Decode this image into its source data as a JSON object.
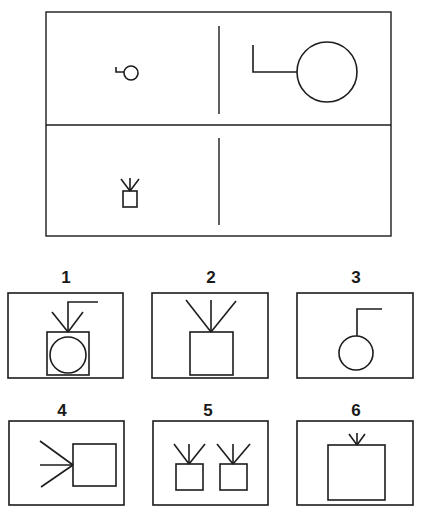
{
  "colors": {
    "ink": "#1c1c1c",
    "background": "#ffffff"
  },
  "matrix": {
    "frame": {
      "x": 46,
      "y": 12,
      "w": 345,
      "h": 224
    },
    "horizontal_divider_y": 125,
    "vertical_dividers": [
      {
        "x": 219,
        "y1": 26,
        "y2": 114
      },
      {
        "x": 219,
        "y1": 138,
        "y2": 225
      }
    ],
    "cells": [
      {
        "id": "top-left",
        "description": "small circle with small L-shaped hook on its left",
        "shapes": [
          {
            "type": "circle",
            "cx": 131,
            "cy": 73,
            "r": 7
          },
          {
            "type": "polyline",
            "points": [
              [
                116,
                67
              ],
              [
                116,
                72
              ],
              [
                124,
                72
              ]
            ]
          }
        ]
      },
      {
        "id": "top-right",
        "description": "large circle with large L-shaped hook on its left",
        "shapes": [
          {
            "type": "circle",
            "cx": 327,
            "cy": 72,
            "r": 30
          },
          {
            "type": "polyline",
            "points": [
              [
                253,
                45
              ],
              [
                253,
                72
              ],
              [
                297,
                72
              ]
            ]
          }
        ]
      },
      {
        "id": "bottom-left",
        "description": "small square with three rays on top",
        "shapes": [
          {
            "type": "rect",
            "x": 123,
            "y": 191,
            "w": 14,
            "h": 16
          },
          {
            "type": "line",
            "x1": 130,
            "y1": 191,
            "x2": 121,
            "y2": 179
          },
          {
            "type": "line",
            "x1": 130,
            "y1": 191,
            "x2": 130,
            "y2": 178
          },
          {
            "type": "line",
            "x1": 130,
            "y1": 191,
            "x2": 139,
            "y2": 179
          }
        ]
      },
      {
        "id": "bottom-right",
        "description": "empty cell (missing answer)",
        "shapes": []
      }
    ]
  },
  "options": [
    {
      "label": "1",
      "label_pos": {
        "x": 66,
        "y": 269
      },
      "frame": {
        "x": 8,
        "y": 293,
        "w": 115,
        "h": 85
      },
      "shapes": [
        {
          "type": "rect",
          "x": 47,
          "y": 332,
          "w": 42,
          "h": 43
        },
        {
          "type": "circle",
          "cx": 68,
          "cy": 355,
          "r": 18
        },
        {
          "type": "line",
          "x1": 68,
          "y1": 332,
          "x2": 52,
          "y2": 312
        },
        {
          "type": "line",
          "x1": 68,
          "y1": 332,
          "x2": 83,
          "y2": 312
        },
        {
          "type": "polyline",
          "points": [
            [
              68,
              332
            ],
            [
              68,
              302
            ],
            [
              98,
              302
            ]
          ]
        }
      ]
    },
    {
      "label": "2",
      "label_pos": {
        "x": 211,
        "y": 269
      },
      "frame": {
        "x": 152,
        "y": 293,
        "w": 116,
        "h": 85
      },
      "shapes": [
        {
          "type": "rect",
          "x": 190,
          "y": 332,
          "w": 43,
          "h": 43
        },
        {
          "type": "line",
          "x1": 211,
          "y1": 332,
          "x2": 186,
          "y2": 300
        },
        {
          "type": "line",
          "x1": 211,
          "y1": 332,
          "x2": 211,
          "y2": 300
        },
        {
          "type": "line",
          "x1": 211,
          "y1": 332,
          "x2": 236,
          "y2": 301
        }
      ]
    },
    {
      "label": "3",
      "label_pos": {
        "x": 356,
        "y": 269
      },
      "frame": {
        "x": 297,
        "y": 293,
        "w": 116,
        "h": 85
      },
      "shapes": [
        {
          "type": "circle",
          "cx": 356,
          "cy": 353,
          "r": 17
        },
        {
          "type": "polyline",
          "points": [
            [
              357,
              336
            ],
            [
              357,
              309
            ],
            [
              382,
              309
            ]
          ]
        }
      ]
    },
    {
      "label": "4",
      "label_pos": {
        "x": 62,
        "y": 402
      },
      "frame": {
        "x": 9,
        "y": 421,
        "w": 115,
        "h": 84
      },
      "shapes": [
        {
          "type": "rect",
          "x": 73,
          "y": 444,
          "w": 43,
          "h": 42
        },
        {
          "type": "line",
          "x1": 73,
          "y1": 465,
          "x2": 40,
          "y2": 441
        },
        {
          "type": "line",
          "x1": 73,
          "y1": 465,
          "x2": 40,
          "y2": 465
        },
        {
          "type": "line",
          "x1": 73,
          "y1": 465,
          "x2": 41,
          "y2": 487
        }
      ]
    },
    {
      "label": "5",
      "label_pos": {
        "x": 208,
        "y": 402
      },
      "frame": {
        "x": 153,
        "y": 421,
        "w": 115,
        "h": 84
      },
      "shapes": [
        {
          "type": "rect",
          "x": 176,
          "y": 464,
          "w": 27,
          "h": 26
        },
        {
          "type": "line",
          "x1": 189,
          "y1": 464,
          "x2": 174,
          "y2": 444
        },
        {
          "type": "line",
          "x1": 189,
          "y1": 464,
          "x2": 189,
          "y2": 444
        },
        {
          "type": "line",
          "x1": 189,
          "y1": 464,
          "x2": 205,
          "y2": 444
        },
        {
          "type": "rect",
          "x": 220,
          "y": 464,
          "w": 27,
          "h": 26
        },
        {
          "type": "line",
          "x1": 233,
          "y1": 464,
          "x2": 217,
          "y2": 444
        },
        {
          "type": "line",
          "x1": 233,
          "y1": 464,
          "x2": 233,
          "y2": 444
        },
        {
          "type": "line",
          "x1": 233,
          "y1": 464,
          "x2": 250,
          "y2": 444
        }
      ]
    },
    {
      "label": "6",
      "label_pos": {
        "x": 356,
        "y": 402
      },
      "frame": {
        "x": 297,
        "y": 421,
        "w": 116,
        "h": 84
      },
      "shapes": [
        {
          "type": "rect",
          "x": 328,
          "y": 445,
          "w": 57,
          "h": 55
        },
        {
          "type": "line",
          "x1": 357,
          "y1": 445,
          "x2": 349,
          "y2": 434
        },
        {
          "type": "line",
          "x1": 357,
          "y1": 445,
          "x2": 357,
          "y2": 433
        },
        {
          "type": "line",
          "x1": 357,
          "y1": 445,
          "x2": 365,
          "y2": 434
        }
      ]
    }
  ]
}
